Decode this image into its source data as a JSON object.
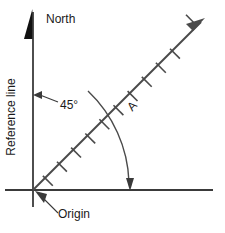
{
  "figure": {
    "labels": {
      "north": "North",
      "reference_line": "Reference line",
      "angle": "45°",
      "origin": "Origin",
      "vector": "A"
    },
    "colors": {
      "line": "#3a3a3a",
      "text": "#1a1a1a",
      "background": "#ffffff"
    },
    "geometry": {
      "origin_px": [
        33,
        190
      ],
      "horizontal_axis": {
        "x1": 5,
        "y1": 190,
        "x2": 213,
        "y2": 190
      },
      "vertical_axis": {
        "x1": 33,
        "y1": 11,
        "x2": 33,
        "y2": 207
      },
      "vector_line": {
        "x1": 33,
        "y1": 190,
        "x2": 205,
        "y2": 18
      },
      "vector_angle_deg": 45,
      "tick_count": 9,
      "tick_spacing_px": 20,
      "arc_radius_px": 132,
      "arc_start_deg_from_north": 45,
      "arc_end_deg_from_north": 90
    }
  }
}
